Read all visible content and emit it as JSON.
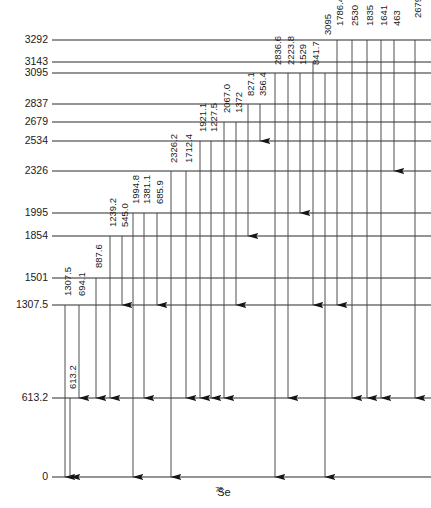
{
  "diagram": {
    "nuclide": {
      "mass_number": "78",
      "symbol": "Se"
    },
    "energy_unit": "keV",
    "levels": [
      {
        "label": "3292",
        "energy": 3292,
        "y": 40,
        "x1": 52,
        "x2": 431
      },
      {
        "label": "3143",
        "energy": 3143,
        "y": 62,
        "x1": 52,
        "x2": 431
      },
      {
        "label": "3095",
        "energy": 3095,
        "y": 73,
        "x1": 52,
        "x2": 431
      },
      {
        "label": "2837",
        "energy": 2837,
        "y": 104,
        "x1": 52,
        "x2": 431
      },
      {
        "label": "2679",
        "energy": 2679,
        "y": 122,
        "x1": 52,
        "x2": 431
      },
      {
        "label": "2534",
        "energy": 2534,
        "y": 141,
        "x1": 52,
        "x2": 431
      },
      {
        "label": "2326",
        "energy": 2326,
        "y": 171,
        "x1": 52,
        "x2": 431
      },
      {
        "label": "1995",
        "energy": 1995,
        "y": 213,
        "x1": 52,
        "x2": 431
      },
      {
        "label": "1854",
        "energy": 1854,
        "y": 236,
        "x1": 52,
        "x2": 431
      },
      {
        "label": "1501",
        "energy": 1501,
        "y": 278,
        "x1": 52,
        "x2": 431
      },
      {
        "label": "1307.5",
        "energy": 1307.5,
        "y": 305,
        "x1": 52,
        "x2": 431
      },
      {
        "label": "613.2",
        "energy": 613.2,
        "y": 398,
        "x1": 52,
        "x2": 431
      },
      {
        "label": "0",
        "energy": 0,
        "y": 477,
        "x1": 52,
        "x2": 431
      }
    ],
    "transitions": [
      {
        "label": "1307.5",
        "x": 65,
        "from_y": 305,
        "to_y": 477,
        "label_y": 296
      },
      {
        "label": "694.1",
        "x": 79,
        "from_y": 305,
        "to_y": 398,
        "label_y": 296
      },
      {
        "label": "613.2",
        "x": 70,
        "from_y": 398,
        "to_y": 477,
        "label_y": 389
      },
      {
        "label": "887.6",
        "x": 96,
        "from_y": 278,
        "to_y": 398,
        "label_y": 268
      },
      {
        "label": "1239.2",
        "x": 110,
        "from_y": 236,
        "to_y": 398,
        "label_y": 227
      },
      {
        "label": "545.0",
        "x": 122,
        "from_y": 236,
        "to_y": 305,
        "label_y": 227
      },
      {
        "label": "1994.8",
        "x": 133,
        "from_y": 213,
        "to_y": 477,
        "label_y": 204
      },
      {
        "label": "1381.1",
        "x": 144,
        "from_y": 213,
        "to_y": 398,
        "label_y": 204
      },
      {
        "label": "685.9",
        "x": 157,
        "from_y": 213,
        "to_y": 305,
        "label_y": 204
      },
      {
        "label": "2326.2",
        "x": 171,
        "from_y": 171,
        "to_y": 477,
        "label_y": 163
      },
      {
        "label": "1712.4",
        "x": 186,
        "from_y": 171,
        "to_y": 398,
        "label_y": 163
      },
      {
        "label": "1921.1",
        "x": 200,
        "from_y": 141,
        "to_y": 398,
        "label_y": 132
      },
      {
        "label": "1227.5",
        "x": 211,
        "from_y": 141,
        "to_y": 398,
        "label_y": 132
      },
      {
        "label": "2067.0",
        "x": 224,
        "from_y": 122,
        "to_y": 398,
        "label_y": 113
      },
      {
        "label": "1372",
        "x": 236,
        "from_y": 122,
        "to_y": 305,
        "label_y": 113
      },
      {
        "label": "827.1",
        "x": 248,
        "from_y": 104,
        "to_y": 236,
        "label_y": 96
      },
      {
        "label": "356.4",
        "x": 260,
        "from_y": 104,
        "to_y": 141,
        "label_y": 96
      },
      {
        "label": "2836.6",
        "x": 275,
        "from_y": 73,
        "to_y": 477,
        "label_y": 65
      },
      {
        "label": "2223.8",
        "x": 288,
        "from_y": 73,
        "to_y": 398,
        "label_y": 65
      },
      {
        "label": "1529",
        "x": 300,
        "from_y": 73,
        "to_y": 213,
        "label_y": 65
      },
      {
        "label": "841.7",
        "x": 313,
        "from_y": 62,
        "to_y": 305,
        "label_y": 65
      },
      {
        "label": "3095",
        "x": 325,
        "from_y": 73,
        "to_y": 477,
        "label_y": 35
      },
      {
        "label": "1786.4",
        "x": 337,
        "from_y": 40,
        "to_y": 305,
        "label_y": 26
      },
      {
        "label": "2530",
        "x": 352,
        "from_y": 40,
        "to_y": 398,
        "label_y": 26
      },
      {
        "label": "1835",
        "x": 367,
        "from_y": 40,
        "to_y": 398,
        "label_y": 26
      },
      {
        "label": "1641",
        "x": 381,
        "from_y": 40,
        "to_y": 398,
        "label_y": 26
      },
      {
        "label": "463",
        "x": 394,
        "from_y": 40,
        "to_y": 171,
        "label_y": 26
      },
      {
        "label": "2679",
        "x": 415,
        "from_y": 40,
        "to_y": 398,
        "label_y": 18
      }
    ]
  },
  "chart_data": {
    "type": "diagram",
    "ylabel": "Energy (keV)",
    "categories": [
      "3292",
      "3143",
      "3095",
      "2837",
      "2679",
      "2534",
      "2326",
      "1995",
      "1854",
      "1501",
      "1307.5",
      "613.2",
      "0"
    ],
    "values": [
      3292,
      3143,
      3095,
      2837,
      2679,
      2534,
      2326,
      1995,
      1854,
      1501,
      1307.5,
      613.2,
      0
    ],
    "gamma_energies": [
      1307.5,
      694.1,
      613.2,
      887.6,
      1239.2,
      545.0,
      1994.8,
      1381.1,
      685.9,
      2326.2,
      1712.4,
      1921.1,
      1227.5,
      2067.0,
      1372,
      827.1,
      356.4,
      2836.6,
      2223.8,
      1529,
      841.7,
      3095,
      1786.4,
      2530,
      1835,
      1641,
      463,
      2679
    ],
    "ylim": [
      0,
      3292
    ],
    "grid": false,
    "legend": "none"
  }
}
